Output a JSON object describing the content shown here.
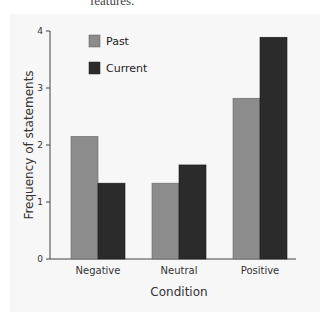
{
  "context": {
    "top_text_fragment": "features."
  },
  "chart_data": {
    "type": "bar",
    "title": "",
    "xlabel": "Condition",
    "ylabel": "Frequency of statements",
    "categories": [
      "Negative",
      "Neutral",
      "Positive"
    ],
    "series": [
      {
        "name": "Past",
        "values": [
          2.15,
          1.33,
          2.82
        ],
        "color": "#8c8c8c"
      },
      {
        "name": "Current",
        "values": [
          1.33,
          1.65,
          3.89
        ],
        "color": "#2b2b2b"
      }
    ],
    "ylim": [
      0,
      4
    ],
    "yticks": [
      "0",
      "1",
      "2",
      "3",
      "4"
    ],
    "grid": false,
    "legend_position": "top-left inside"
  }
}
